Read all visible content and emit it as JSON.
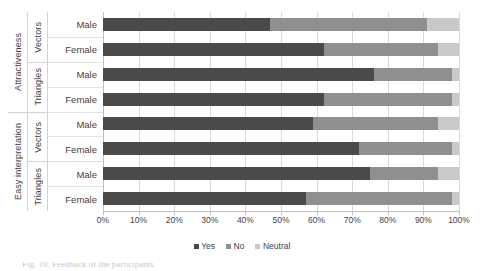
{
  "chart_data": {
    "type": "bar",
    "orientation": "horizontal",
    "stacked": true,
    "stack_mode": "percent",
    "title": "",
    "xlabel": "",
    "ylabel": "",
    "xlim": [
      0,
      100
    ],
    "grid": true,
    "legend_position": "bottom",
    "tick_labels": [
      "0%",
      "10%",
      "20%",
      "30%",
      "40%",
      "50%",
      "60%",
      "70%",
      "80%",
      "90%",
      "100%"
    ],
    "tick_values": [
      0,
      10,
      20,
      30,
      40,
      50,
      60,
      70,
      80,
      90,
      100
    ],
    "legend": [
      "Yes",
      "No",
      "Neutral"
    ],
    "series": [
      {
        "name": "Yes",
        "color": "#4a4a4a",
        "values": [
          47,
          62,
          76,
          62,
          59,
          72,
          75,
          57
        ]
      },
      {
        "name": "No",
        "color": "#8f8f8f",
        "values": [
          44,
          32,
          22,
          36,
          35,
          26,
          19,
          41
        ]
      },
      {
        "name": "Neutral",
        "color": "#c9c9c9",
        "values": [
          9,
          6,
          2,
          2,
          6,
          2,
          6,
          2
        ]
      }
    ],
    "categories": [
      "Attractiveness / Vectors / Male",
      "Attractiveness / Vectors / Female",
      "Attractiveness / Triangles / Male",
      "Attractiveness / Triangles / Female",
      "Easy interpretation / Vectors / Male",
      "Easy interpretation / Vectors / Female",
      "Easy interpretation / Triangles / Male",
      "Easy interpretation / Triangles / Female"
    ],
    "category_axis": {
      "outer": [
        {
          "label": "Attractiveness",
          "span": 4
        },
        {
          "label": "Easy interpretation",
          "span": 4
        }
      ],
      "middle": [
        {
          "label": "Vectors",
          "span": 2
        },
        {
          "label": "Triangles",
          "span": 2
        },
        {
          "label": "Vectors",
          "span": 2
        },
        {
          "label": "Triangles",
          "span": 2
        }
      ],
      "inner": [
        "Male",
        "Female",
        "Male",
        "Female",
        "Male",
        "Female",
        "Male",
        "Female"
      ]
    }
  },
  "caption": {
    "text": "Fig. 10. Feedback of the participants"
  }
}
